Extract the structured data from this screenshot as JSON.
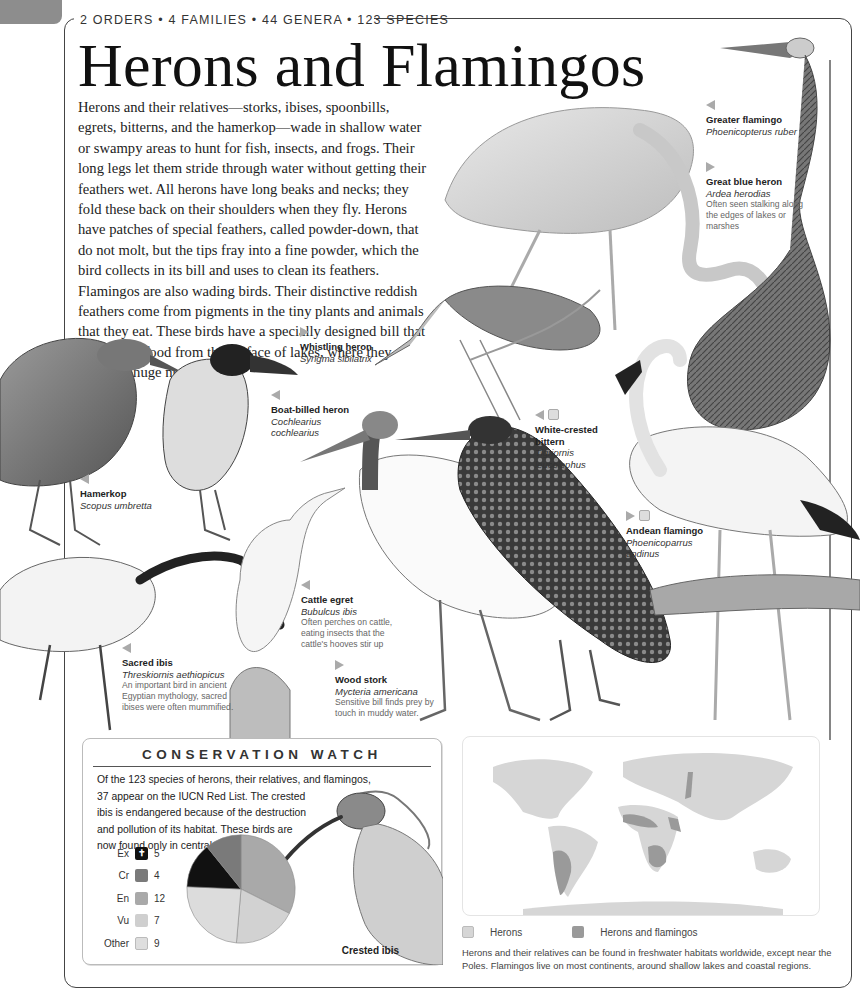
{
  "header": {
    "kicker": "2 ORDERS • 4 FAMILIES • 44 GENERA • 123 SPECIES",
    "title": "Herons and Flamingos"
  },
  "intro": {
    "text": "Herons and their relatives—storks, ibises, spoonbills, egrets, bitterns, and the hamerkop—wade in shallow water or swampy areas to hunt for fish, insects, and frogs. Their long legs let them stride through water without getting their feathers wet. All herons have long beaks and necks; they fold these back on their shoulders when they fly. Herons have patches of special feathers, called powder-down, that do not molt, but the tips fray into a fine powder, which the bird collects in its bill and uses to clean its feathers. Flamingos are also wading birds. Their distinctive reddish feathers come from pigments in the tiny plants and animals that they eat. These birds have a specially designed bill that strains this food from the surface of lakes, where they gather in huge numbers."
  },
  "species": [
    {
      "id": "greater-flamingo",
      "arrow": "left",
      "status": null,
      "common": "Greater flamingo",
      "scientific": "Phoenicopterus ruber",
      "note": ""
    },
    {
      "id": "great-blue-heron",
      "arrow": "right",
      "status": null,
      "common": "Great blue heron",
      "scientific": "Ardea herodias",
      "note": "Often seen stalking along the edges of lakes or marshes"
    },
    {
      "id": "whistling-heron",
      "arrow": "right",
      "status": null,
      "common": "Whistling heron",
      "scientific": "Syrigma sibilatrix",
      "note": ""
    },
    {
      "id": "boat-billed-heron",
      "arrow": "left",
      "status": null,
      "common": "Boat-billed heron",
      "scientific": "Cochlearius cochlearius",
      "note": ""
    },
    {
      "id": "white-crested-bittern",
      "arrow": "left",
      "status": "Vu",
      "common": "White-crested bittern",
      "scientific": "Tigriornis leucolophus",
      "note": ""
    },
    {
      "id": "hamerkop",
      "arrow": "left",
      "status": null,
      "common": "Hamerkop",
      "scientific": "Scopus umbretta",
      "note": ""
    },
    {
      "id": "andean-flamingo",
      "arrow": "right",
      "status": "Vu",
      "common": "Andean flamingo",
      "scientific": "Phoenicoparrus andinus",
      "note": ""
    },
    {
      "id": "cattle-egret",
      "arrow": "left",
      "status": null,
      "common": "Cattle egret",
      "scientific": "Bubulcus ibis",
      "note": "Often perches on cattle, eating insects that the cattle's hooves stir up"
    },
    {
      "id": "sacred-ibis",
      "arrow": "left",
      "status": null,
      "common": "Sacred ibis",
      "scientific": "Threskiornis aethiopicus",
      "note": "An important bird in ancient Egyptian mythology, sacred ibises were often mummified."
    },
    {
      "id": "wood-stork",
      "arrow": "right",
      "status": null,
      "common": "Wood stork",
      "scientific": "Mycteria americana",
      "note": "Sensitive bill finds prey by touch in muddy water."
    }
  ],
  "conservation": {
    "title": "CONSERVATION WATCH",
    "text_lines": [
      "Of the 123 species of herons, their relatives, and flamingos,",
      "37 appear on the IUCN Red List. The crested",
      "ibis is endangered because of the destruction",
      "and pollution of its habitat. These birds are",
      "now found only in central China."
    ],
    "legend": [
      {
        "code": "Ex",
        "count": "5",
        "color": "#111111"
      },
      {
        "code": "Cr",
        "count": "4",
        "color": "#7a7a7a"
      },
      {
        "code": "En",
        "count": "12",
        "color": "#a9a9a9"
      },
      {
        "code": "Vu",
        "count": "7",
        "color": "#cfcfcf"
      },
      {
        "code": "Other",
        "count": "9",
        "color": "#dedede"
      }
    ],
    "ibis_caption": "Crested ibis"
  },
  "chart_data": {
    "type": "pie",
    "categories": [
      "Ex",
      "Cr",
      "En",
      "Vu",
      "Other"
    ],
    "values": [
      5,
      4,
      12,
      7,
      9
    ],
    "colors": [
      "#111111",
      "#7a7a7a",
      "#a9a9a9",
      "#d2d2d2",
      "#dcdcdc"
    ]
  },
  "distribution": {
    "legend": [
      {
        "label": "Herons",
        "color": "#d6d6d6"
      },
      {
        "label": "Herons and flamingos",
        "color": "#9a9a9a"
      }
    ],
    "caption": "Herons and their relatives can be found in freshwater habitats worldwide, except near the Poles. Flamingos live on most continents, around shallow lakes and coastal regions."
  }
}
